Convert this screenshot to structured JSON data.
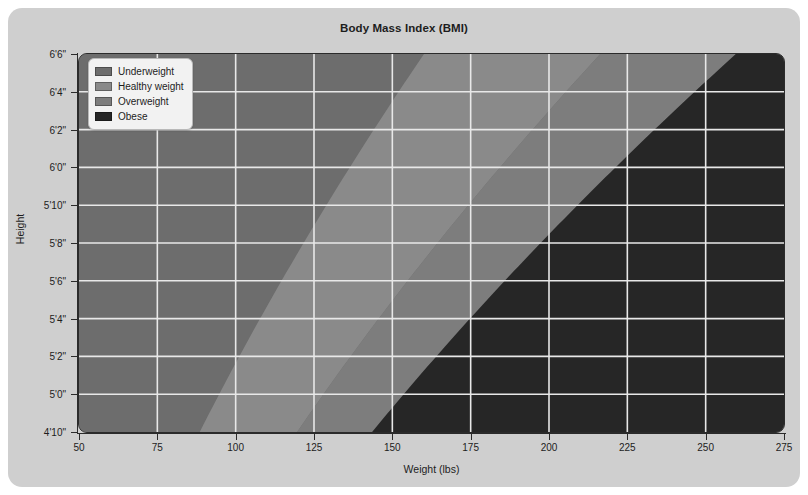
{
  "chart_data": {
    "type": "heatmap",
    "title": "Body Mass Index (BMI)",
    "xlabel": "Weight (lbs)",
    "ylabel": "Height",
    "xlim": [
      50,
      275
    ],
    "ylim": [
      58,
      78
    ],
    "grid": true,
    "legend_position": "top-left",
    "x_ticks": [
      {
        "value": 50,
        "label": "50"
      },
      {
        "value": 75,
        "label": "75"
      },
      {
        "value": 100,
        "label": "100"
      },
      {
        "value": 125,
        "label": "125"
      },
      {
        "value": 150,
        "label": "150"
      },
      {
        "value": 175,
        "label": "175"
      },
      {
        "value": 200,
        "label": "200"
      },
      {
        "value": 225,
        "label": "225"
      },
      {
        "value": 250,
        "label": "250"
      },
      {
        "value": 275,
        "label": "275"
      }
    ],
    "y_ticks": [
      {
        "value": 58,
        "label": "4'10\""
      },
      {
        "value": 60,
        "label": "5'0\""
      },
      {
        "value": 62,
        "label": "5'2\""
      },
      {
        "value": 64,
        "label": "5'4\""
      },
      {
        "value": 66,
        "label": "5'6\""
      },
      {
        "value": 68,
        "label": "5'8\""
      },
      {
        "value": 70,
        "label": "5'10\""
      },
      {
        "value": 72,
        "label": "6'0\""
      },
      {
        "value": 74,
        "label": "6'2\""
      },
      {
        "value": 76,
        "label": "6'4\""
      },
      {
        "value": 78,
        "label": "6'6\""
      }
    ],
    "categories": [
      "Underweight",
      "Healthy weight",
      "Overweight",
      "Obese"
    ],
    "bmi_thresholds": [
      18.5,
      25,
      30
    ],
    "series": [
      {
        "name": "Underweight",
        "bmi_range": [
          0,
          18.5
        ],
        "color": "#6d6d6d"
      },
      {
        "name": "Healthy weight",
        "bmi_range": [
          18.5,
          25
        ],
        "color": "#8a8a8a"
      },
      {
        "name": "Overweight",
        "bmi_range": [
          25,
          30
        ],
        "color": "#7d7d7d"
      },
      {
        "name": "Obese",
        "bmi_range": [
          30,
          100
        ],
        "color": "#262626"
      }
    ]
  },
  "legend": {
    "items": [
      {
        "label": "Underweight",
        "color": "#6d6d6d"
      },
      {
        "label": "Healthy weight",
        "color": "#8a8a8a"
      },
      {
        "label": "Overweight",
        "color": "#7d7d7d"
      },
      {
        "label": "Obese",
        "color": "#262626"
      }
    ]
  },
  "colors": {
    "page_background": "#ffffff",
    "card_background": "#cfcfcf",
    "axis": "#2b2b2b",
    "gridline": "#e8e8e8",
    "text": "#1d1d1d",
    "legend_background": "#f2f2f2",
    "legend_border": "#b9b9b9"
  }
}
